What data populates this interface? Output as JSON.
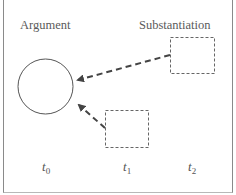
{
  "diagram": {
    "labels": {
      "argument": "Argument",
      "substantiation": "Substantiation"
    },
    "time_axis": [
      {
        "var": "t",
        "sub": "0"
      },
      {
        "var": "t",
        "sub": "1"
      },
      {
        "var": "t",
        "sub": "2"
      }
    ],
    "nodes": [
      {
        "id": "argument-circle",
        "shape": "circle",
        "style": "solid",
        "time": "t0"
      },
      {
        "id": "substantiation-box-t2",
        "shape": "rectangle",
        "style": "dashed",
        "time": "t2"
      },
      {
        "id": "substantiation-box-t1",
        "shape": "rectangle",
        "style": "dashed",
        "time": "t1"
      }
    ],
    "edges": [
      {
        "from": "substantiation-box-t2",
        "to": "argument-circle",
        "style": "dashed-arrow"
      },
      {
        "from": "substantiation-box-t1",
        "to": "argument-circle",
        "style": "dashed-arrow"
      }
    ],
    "colors": {
      "stroke": "#555555",
      "dashed_stroke": "#666666",
      "text": "#5a5a5a",
      "frame": "#8a8a8a"
    }
  }
}
